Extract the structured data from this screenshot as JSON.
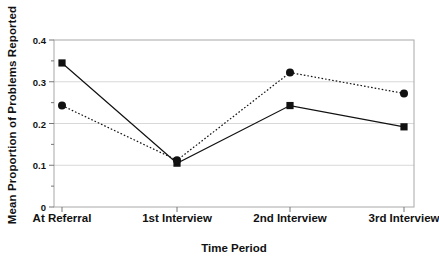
{
  "chart_data": {
    "type": "line",
    "title": "",
    "xlabel": "Time Period",
    "ylabel": "Mean Proportion of Problems Reported",
    "categories": [
      "At Referral",
      "1st Interview",
      "2nd Interview",
      "3rd Interview"
    ],
    "ylim": [
      0,
      0.4
    ],
    "ytick_labels": [
      "0",
      "0.1",
      "0.2",
      "0.3",
      "0.4"
    ],
    "ytick_values": [
      0,
      0.1,
      0.2,
      0.3,
      0.4
    ],
    "yminor_values": [
      0.05,
      0.15,
      0.25,
      0.35
    ],
    "grid": "horizontal-major",
    "gridlines_at": [
      0.1,
      0.2,
      0.3
    ],
    "legend": "none",
    "series": [
      {
        "name": "Series 1",
        "line_style": "solid",
        "marker": "square",
        "color": "#111111",
        "values": [
          0.345,
          0.105,
          0.243,
          0.192
        ]
      },
      {
        "name": "Series 2",
        "line_style": "dotted",
        "marker": "circle",
        "color": "#111111",
        "values": [
          0.243,
          0.112,
          0.322,
          0.272
        ]
      }
    ]
  },
  "axis": {
    "frame_color": "#a8a8a8",
    "grid_color": "#d8d8d8",
    "tick_color": "#777777"
  }
}
